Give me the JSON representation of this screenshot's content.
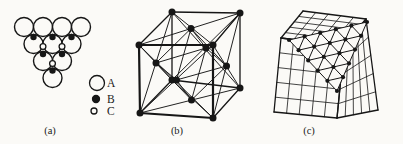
{
  "figure": {
    "background": "#fbfaf7",
    "ink": "#161616"
  },
  "panel_a": {
    "label": "(a)",
    "large_circle_radius": 9.5,
    "circle_stroke_width": 1.4,
    "sphere_rows": [
      {
        "y": 27,
        "xs": [
          24,
          43,
          62,
          81
        ]
      },
      {
        "y": 44,
        "xs": [
          33.5,
          52.5,
          71.5
        ]
      },
      {
        "y": 61,
        "xs": [
          43,
          62
        ]
      },
      {
        "y": 78,
        "xs": [
          52.5
        ]
      }
    ],
    "b_sites": [
      [
        33.5,
        37
      ],
      [
        52.5,
        37
      ],
      [
        71.5,
        37
      ],
      [
        43,
        54
      ],
      [
        62,
        54
      ],
      [
        52.5,
        70.5
      ]
    ],
    "b_radius": 3.2,
    "c_sites": [
      [
        43,
        46.5
      ],
      [
        62,
        46.5
      ],
      [
        52.5,
        63.5
      ]
    ],
    "c_radius": 2.9,
    "legend": [
      {
        "label": "A",
        "cx": 97,
        "cy": 83,
        "r": 7.5,
        "filled": false
      },
      {
        "label": "B",
        "cx": 96,
        "cy": 99,
        "r": 3.5,
        "filled": true
      },
      {
        "label": "C",
        "cx": 94,
        "cy": 111,
        "r": 3.0,
        "filled": false
      }
    ],
    "legend_text_x": 107,
    "label_pos": [
      50,
      134
    ]
  },
  "panel_b": {
    "label": "(b)",
    "front_face": [
      [
        139,
        45
      ],
      [
        213,
        45
      ],
      [
        213,
        118
      ],
      [
        140,
        113
      ]
    ],
    "back_face": [
      [
        172,
        12
      ],
      [
        240,
        13
      ],
      [
        240,
        88
      ],
      [
        172,
        80
      ]
    ],
    "face_centers": [
      [
        176.5,
        80
      ],
      [
        206,
        48
      ],
      [
        191,
        28.5
      ],
      [
        191.5,
        100
      ],
      [
        156,
        63
      ],
      [
        226.5,
        66
      ]
    ],
    "dot_radius": 3.5,
    "edge_width_front": 2.2,
    "edge_width_back": 1.3,
    "diagonal_width": 0.95,
    "label_pos": [
      177,
      134
    ]
  },
  "panel_c": {
    "label": "(c)",
    "top_face": [
      [
        281,
        38
      ],
      [
        303,
        11
      ],
      [
        366,
        19
      ],
      [
        344,
        46
      ]
    ],
    "left_face": [
      [
        281,
        38
      ],
      [
        344,
        46
      ],
      [
        337,
        118
      ],
      [
        274,
        112
      ]
    ],
    "right_face": [
      [
        344,
        46
      ],
      [
        366,
        19
      ],
      [
        378,
        110
      ],
      [
        337,
        118
      ]
    ],
    "grid_divisions": 5,
    "grid_width": 0.8,
    "outline_width": 1.3,
    "plane_triangle": {
      "vertices": [
        [
          289,
          40
        ],
        [
          367,
          22
        ],
        [
          337,
          91
        ]
      ],
      "dots_per_edge": 6,
      "dot_radius": 2.1,
      "mesh_width": 1.0
    },
    "label_pos": [
      309,
      134
    ]
  }
}
